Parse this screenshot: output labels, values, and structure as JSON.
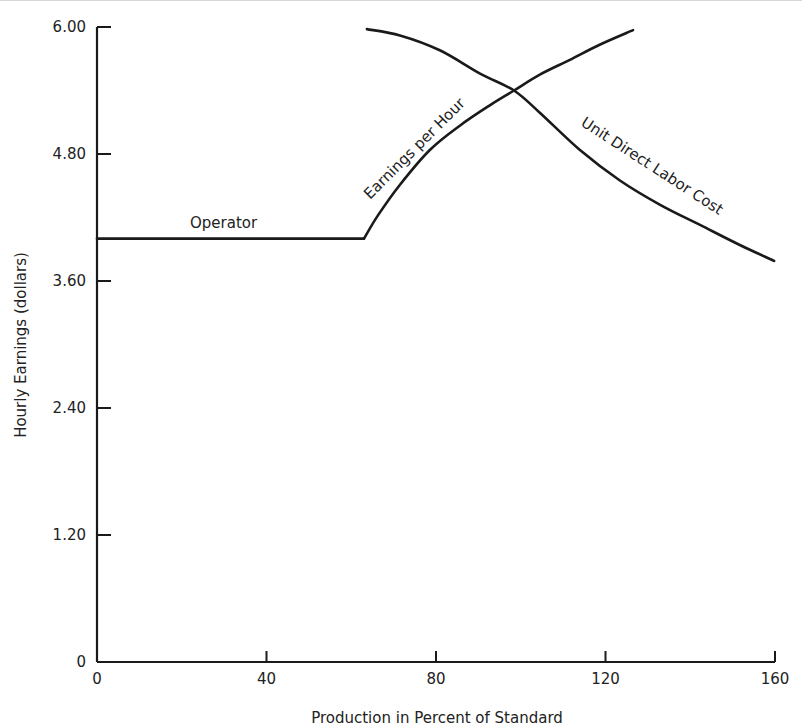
{
  "chart_data": {
    "type": "line",
    "title": "",
    "xlabel": "Production in Percent of Standard",
    "ylabel": "Hourly Earnings (dollars)",
    "xlim": [
      0,
      160
    ],
    "ylim": [
      0,
      6.0
    ],
    "x_ticks": [
      0,
      40,
      80,
      120,
      160
    ],
    "x_tick_labels": [
      "0",
      "40",
      "80",
      "120",
      "160"
    ],
    "y_ticks": [
      0,
      1.2,
      2.4,
      3.6,
      4.8,
      6.0
    ],
    "y_tick_labels": [
      "0",
      "1.20",
      "2.40",
      "3.60",
      "4.80",
      "6.00"
    ],
    "grid": false,
    "legend": "none (curves labeled inline)",
    "series": [
      {
        "name": "Operator",
        "label": "Operator",
        "x": [
          0,
          63
        ],
        "y": [
          4.0,
          4.0
        ]
      },
      {
        "name": "Earnings per Hour",
        "label": "Earnings per Hour",
        "x": [
          63,
          66.3,
          71.5,
          78.6,
          85.7,
          92.7,
          98.4,
          104.5,
          111.6,
          118.5,
          126.5
        ],
        "y": [
          4.0,
          4.22,
          4.51,
          4.84,
          5.07,
          5.26,
          5.4,
          5.55,
          5.69,
          5.83,
          5.97
        ]
      },
      {
        "name": "Unit Direct Labor Cost",
        "label": "Unit Direct Labor Cost",
        "x": [
          63.7,
          71.5,
          80.9,
          90.4,
          98.4,
          104.5,
          113.9,
          123.4,
          132.9,
          142.3,
          151.7,
          159.8
        ],
        "y": [
          5.98,
          5.92,
          5.78,
          5.56,
          5.4,
          5.19,
          4.84,
          4.55,
          4.32,
          4.13,
          3.94,
          3.79
        ]
      }
    ]
  }
}
